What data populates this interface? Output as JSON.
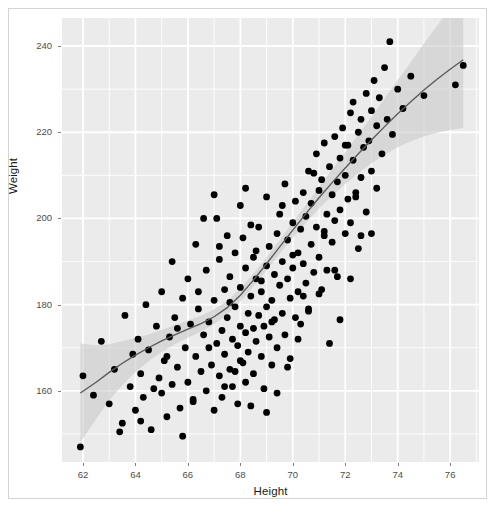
{
  "chart_data": {
    "type": "scatter",
    "title": "",
    "xlabel": "Height",
    "ylabel": "Weight",
    "xlim": [
      61.2,
      77.1
    ],
    "ylim": [
      143.5,
      246.5
    ],
    "xticks": [
      62,
      64,
      66,
      68,
      70,
      72,
      74,
      76
    ],
    "xtick_labels": [
      "62",
      "64",
      "66",
      "68",
      "70",
      "72",
      "74",
      "76"
    ],
    "yticks": [
      160,
      180,
      200,
      220,
      240
    ],
    "ytick_labels": [
      "160",
      "180",
      "200",
      "220",
      "240"
    ],
    "x_minor_ticks": [
      63,
      65,
      67,
      69,
      71,
      73,
      75,
      77
    ],
    "y_minor_ticks": [
      150,
      170,
      190,
      210,
      230
    ],
    "grid": true,
    "grid_color": "#ffffff",
    "panel_background": "#ebebeb",
    "legend": "none",
    "point_color": "#000000",
    "point_size": 3.4,
    "smooth": {
      "method": "loess",
      "line_color": "#595959",
      "ribbon_color": "#cccccc",
      "ribbon_label": "95% confidence interval"
    },
    "x": [
      61.9,
      62.0,
      62.4,
      62.7,
      63.0,
      63.2,
      63.5,
      63.6,
      63.8,
      63.9,
      64.0,
      64.1,
      64.2,
      64.3,
      64.4,
      64.5,
      64.6,
      64.8,
      64.9,
      65.0,
      65.0,
      65.1,
      65.2,
      65.3,
      65.4,
      65.4,
      65.5,
      65.6,
      65.7,
      65.8,
      65.9,
      66.0,
      66.0,
      66.1,
      66.2,
      66.3,
      66.3,
      66.4,
      66.5,
      66.6,
      66.7,
      66.7,
      66.8,
      66.9,
      67.0,
      67.0,
      67.1,
      67.1,
      67.2,
      67.2,
      67.3,
      67.3,
      67.4,
      67.4,
      67.5,
      67.5,
      67.6,
      67.6,
      67.7,
      67.7,
      67.8,
      67.8,
      67.9,
      67.9,
      68.0,
      68.0,
      68.0,
      68.1,
      68.1,
      68.2,
      68.2,
      68.2,
      68.3,
      68.3,
      68.4,
      68.4,
      68.5,
      68.5,
      68.5,
      68.6,
      68.6,
      68.7,
      68.7,
      68.8,
      68.8,
      68.9,
      68.9,
      69.0,
      69.0,
      69.0,
      69.1,
      69.1,
      69.2,
      69.2,
      69.3,
      69.3,
      69.4,
      69.4,
      69.5,
      69.5,
      69.6,
      69.6,
      69.7,
      69.7,
      69.8,
      69.8,
      69.9,
      69.9,
      70.0,
      70.0,
      70.1,
      70.1,
      70.2,
      70.2,
      70.3,
      70.3,
      70.4,
      70.4,
      70.5,
      70.5,
      70.6,
      70.6,
      70.7,
      70.7,
      70.8,
      70.9,
      70.9,
      71.0,
      71.0,
      71.1,
      71.1,
      71.2,
      71.2,
      71.3,
      71.3,
      71.4,
      71.5,
      71.5,
      71.6,
      71.6,
      71.7,
      71.7,
      71.8,
      71.8,
      71.9,
      72.0,
      72.0,
      72.1,
      72.1,
      72.2,
      72.2,
      72.3,
      72.3,
      72.4,
      72.5,
      72.5,
      72.6,
      72.6,
      72.7,
      72.8,
      72.8,
      72.9,
      73.0,
      73.0,
      73.1,
      73.2,
      73.2,
      73.3,
      73.4,
      73.5,
      73.6,
      73.7,
      73.8,
      74.0,
      74.2,
      74.5,
      75.0,
      76.2,
      76.5,
      64.7,
      65.6,
      66.4,
      66.8,
      67.2,
      67.6,
      68.0,
      68.4,
      68.8,
      69.2,
      69.6,
      70.0,
      70.4,
      70.8,
      71.2,
      71.6,
      72.0,
      72.4,
      65.2,
      66.2,
      67.0,
      67.8,
      68.6,
      69.4,
      70.2,
      71.0,
      71.8,
      72.6,
      63.4,
      64.2,
      65.8,
      66.6,
      67.4,
      68.2,
      69.0,
      69.8,
      70.6,
      71.4,
      72.2,
      73.0
    ],
    "y": [
      147.0,
      163.5,
      159.0,
      171.5,
      157.0,
      165.0,
      152.5,
      177.5,
      161.0,
      168.5,
      155.5,
      172.0,
      164.0,
      158.5,
      180.0,
      169.5,
      151.0,
      175.0,
      163.0,
      159.5,
      183.0,
      167.0,
      154.0,
      172.5,
      161.5,
      190.0,
      177.0,
      165.5,
      156.0,
      181.5,
      170.0,
      162.0,
      186.0,
      175.5,
      158.0,
      168.0,
      194.0,
      179.0,
      164.5,
      173.0,
      160.0,
      188.0,
      176.0,
      166.0,
      155.5,
      181.0,
      171.0,
      200.0,
      163.5,
      190.5,
      174.0,
      158.5,
      183.5,
      168.5,
      177.0,
      196.0,
      165.0,
      186.5,
      172.0,
      161.0,
      179.5,
      192.0,
      170.5,
      157.0,
      175.0,
      184.0,
      203.0,
      166.5,
      195.5,
      173.5,
      162.0,
      188.5,
      178.0,
      169.0,
      182.0,
      156.5,
      174.5,
      191.0,
      164.0,
      186.0,
      171.5,
      177.5,
      198.0,
      168.0,
      183.0,
      175.0,
      160.5,
      189.0,
      179.5,
      205.0,
      172.5,
      193.5,
      181.0,
      166.0,
      187.0,
      176.5,
      196.5,
      170.0,
      184.5,
      201.0,
      178.0,
      190.0,
      173.0,
      208.0,
      186.0,
      195.0,
      181.5,
      167.5,
      199.0,
      188.5,
      177.0,
      204.0,
      192.0,
      183.0,
      197.5,
      175.5,
      206.0,
      189.5,
      200.5,
      185.0,
      179.0,
      211.0,
      194.0,
      203.5,
      187.5,
      198.0,
      215.0,
      191.0,
      206.5,
      183.5,
      209.0,
      196.0,
      217.5,
      201.0,
      188.0,
      212.0,
      205.5,
      194.5,
      219.0,
      199.5,
      208.5,
      186.5,
      214.0,
      202.0,
      221.0,
      196.5,
      210.0,
      217.0,
      204.5,
      224.5,
      199.0,
      213.5,
      227.0,
      206.0,
      220.0,
      193.0,
      223.0,
      209.5,
      216.5,
      229.0,
      201.5,
      218.0,
      225.0,
      211.0,
      232.0,
      221.5,
      207.0,
      228.0,
      215.0,
      235.0,
      223.0,
      241.0,
      219.5,
      230.0,
      225.5,
      233.0,
      228.5,
      231.0,
      235.5,
      160.5,
      174.5,
      183.0,
      170.0,
      193.5,
      180.5,
      167.0,
      198.5,
      185.5,
      176.0,
      203.0,
      191.5,
      182.0,
      210.5,
      197.0,
      188.0,
      217.0,
      205.0,
      168.0,
      157.5,
      205.5,
      164.5,
      192.5,
      159.5,
      172.0,
      182.5,
      176.5,
      196.0,
      150.5,
      153.0,
      149.5,
      200.0,
      161.0,
      207.0,
      155.0,
      165.5,
      178.5,
      171.0,
      186.0,
      196.5
    ],
    "smooth_x": [
      61.9,
      62.5,
      63.0,
      63.5,
      64.0,
      64.5,
      65.0,
      65.5,
      66.0,
      66.5,
      67.0,
      67.5,
      68.0,
      68.5,
      69.0,
      69.5,
      70.0,
      70.5,
      71.0,
      71.5,
      72.0,
      72.5,
      73.0,
      73.5,
      74.0,
      74.5,
      75.0,
      75.5,
      76.0,
      76.5
    ],
    "smooth_y": [
      159.5,
      162.0,
      164.3,
      166.4,
      168.3,
      170.0,
      171.6,
      173.0,
      174.3,
      175.6,
      177.2,
      179.3,
      182.2,
      185.7,
      189.5,
      193.4,
      197.3,
      201.1,
      204.8,
      208.3,
      211.7,
      215.0,
      218.2,
      221.3,
      224.3,
      227.1,
      229.8,
      232.3,
      234.6,
      236.8
    ],
    "smooth_ymin": [
      148.0,
      153.5,
      157.8,
      161.3,
      164.3,
      166.9,
      169.0,
      170.8,
      172.3,
      173.8,
      175.5,
      177.7,
      180.7,
      184.2,
      188.0,
      191.8,
      195.5,
      199.0,
      202.3,
      205.2,
      208.0,
      210.5,
      212.8,
      214.8,
      216.5,
      217.9,
      219.0,
      219.9,
      220.5,
      221.0
    ],
    "smooth_ymax": [
      171.0,
      170.5,
      170.8,
      171.5,
      172.3,
      173.1,
      174.2,
      175.2,
      176.3,
      177.4,
      178.9,
      180.9,
      183.7,
      187.2,
      191.0,
      195.0,
      199.1,
      203.2,
      207.3,
      211.4,
      215.4,
      219.5,
      223.6,
      227.8,
      232.1,
      236.3,
      240.6,
      244.7,
      248.7,
      252.6
    ]
  }
}
